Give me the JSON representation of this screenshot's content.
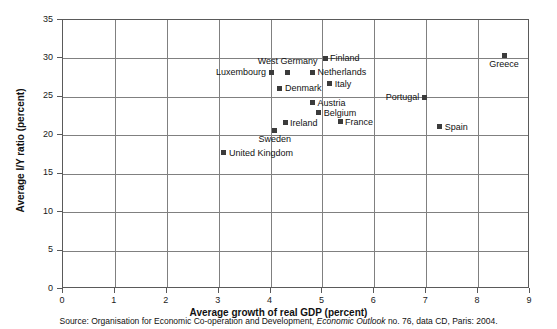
{
  "chart_data": {
    "type": "scatter",
    "title": "",
    "xlabel": "Average growth of real GDP (percent)",
    "ylabel": "Average I/Y ratio (percent)",
    "xlim": [
      0,
      9
    ],
    "ylim": [
      0,
      35
    ],
    "xticks": [
      "0",
      "1",
      "2",
      "3",
      "4",
      "5",
      "6",
      "7",
      "8",
      "9"
    ],
    "yticks": [
      "0",
      "5",
      "10",
      "15",
      "20",
      "25",
      "30",
      "35"
    ],
    "grid": true,
    "legend": "none",
    "marker_color": "#3b3b3b",
    "points": [
      {
        "label": "Luxembourg",
        "x": 4.03,
        "y": 28.1,
        "label_pos": "left"
      },
      {
        "label": "West Germany",
        "x": 4.35,
        "y": 28.1,
        "label_pos": "above"
      },
      {
        "label": "Finland",
        "x": 5.07,
        "y": 29.9,
        "label_pos": "right"
      },
      {
        "label": "Netherlands",
        "x": 4.83,
        "y": 28.1,
        "label_pos": "right"
      },
      {
        "label": "Italy",
        "x": 5.16,
        "y": 26.6,
        "label_pos": "right"
      },
      {
        "label": "Denmark",
        "x": 4.2,
        "y": 26.0,
        "label_pos": "right"
      },
      {
        "label": "Austria",
        "x": 4.83,
        "y": 24.1,
        "label_pos": "right"
      },
      {
        "label": "Belgium",
        "x": 4.95,
        "y": 22.8,
        "label_pos": "right"
      },
      {
        "label": "France",
        "x": 5.36,
        "y": 21.6,
        "label_pos": "right"
      },
      {
        "label": "Ireland",
        "x": 4.3,
        "y": 21.5,
        "label_pos": "right"
      },
      {
        "label": "Sweden",
        "x": 4.1,
        "y": 20.5,
        "label_pos": "below"
      },
      {
        "label": "United Kingdom",
        "x": 3.12,
        "y": 17.6,
        "label_pos": "right"
      },
      {
        "label": "Portugal",
        "x": 6.98,
        "y": 24.8,
        "label_pos": "left"
      },
      {
        "label": "Spain",
        "x": 7.28,
        "y": 21.0,
        "label_pos": "right"
      },
      {
        "label": "Greece",
        "x": 8.52,
        "y": 30.3,
        "label_pos": "below"
      }
    ]
  },
  "source": {
    "prefix": "Source: Organisation for Economic Co-operation and Development, ",
    "italic": "Economic Outlook",
    "suffix": " no. 76, data CD, Paris: 2004."
  }
}
